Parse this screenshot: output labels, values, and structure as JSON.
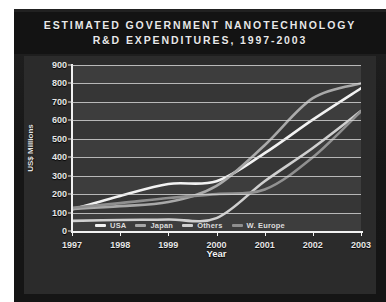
{
  "poster": {
    "background_color": "#191919",
    "panel_color": "#2b2b2b",
    "plot_color": "#363636"
  },
  "title": {
    "line1": "ESTIMATED GOVERNMENT NANOTECHNOLOGY",
    "line2": "R&D EXPENDITURES, 1997-2003"
  },
  "axes": {
    "y_title": "US$ Millions",
    "x_title": "Year",
    "y_ticks": [
      "900",
      "800",
      "700",
      "600",
      "500",
      "400",
      "300",
      "200",
      "100",
      "0"
    ],
    "x_ticks": [
      "1997",
      "1998",
      "1999",
      "2000",
      "2001",
      "2002",
      "2003"
    ]
  },
  "legend": {
    "items": [
      {
        "label": "USA",
        "color": "#f2f2f2"
      },
      {
        "label": "Japan",
        "color": "#a8a8a8"
      },
      {
        "label": "Others",
        "color": "#cfcfcf"
      },
      {
        "label": "W. Europe",
        "color": "#8f8f8f"
      }
    ]
  },
  "chart_data": {
    "type": "line",
    "title": "Estimated Government Nanotechnology R&D Expenditures, 1997-2003",
    "xlabel": "Year",
    "ylabel": "US$ Millions",
    "x": [
      1997,
      1998,
      1999,
      2000,
      2001,
      2002,
      2003
    ],
    "xlim": [
      1997,
      2003
    ],
    "ylim": [
      0,
      900
    ],
    "ytick_step": 100,
    "grid": "horizontal",
    "legend_position": "bottom",
    "series": [
      {
        "name": "USA",
        "color": "#f2f2f2",
        "values": [
          116,
          190,
          255,
          270,
          422,
          604,
          774
        ]
      },
      {
        "name": "Japan",
        "color": "#a8a8a8",
        "values": [
          120,
          135,
          157,
          245,
          465,
          720,
          800
        ]
      },
      {
        "name": "Others",
        "color": "#cfcfcf",
        "values": [
          55,
          60,
          62,
          70,
          270,
          450,
          650
        ]
      },
      {
        "name": "W. Europe",
        "color": "#8f8f8f",
        "values": [
          126,
          151,
          179,
          200,
          225,
          400,
          650
        ]
      }
    ]
  }
}
